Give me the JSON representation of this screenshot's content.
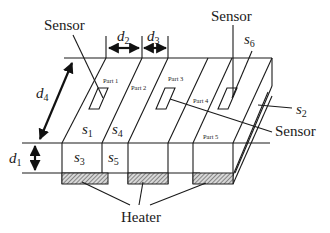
{
  "diagram": {
    "type": "3d-schematic",
    "labels": {
      "sensor_top_left": "Sensor",
      "sensor_top_right": "Sensor",
      "sensor_right": "Sensor",
      "heater": "Heater"
    },
    "dimensions": {
      "d1": {
        "var": "d",
        "sub": "1"
      },
      "d2": {
        "var": "d",
        "sub": "2"
      },
      "d3": {
        "var": "d",
        "sub": "3"
      },
      "d4": {
        "var": "d",
        "sub": "4"
      }
    },
    "surfaces": {
      "s1": {
        "var": "s",
        "sub": "1"
      },
      "s2": {
        "var": "s",
        "sub": "2"
      },
      "s3": {
        "var": "s",
        "sub": "3"
      },
      "s4": {
        "var": "s",
        "sub": "4"
      },
      "s5": {
        "var": "s",
        "sub": "5"
      },
      "s6": {
        "var": "s",
        "sub": "6"
      }
    },
    "parts": [
      "Part 1",
      "Part 2",
      "Part 3",
      "Part 4",
      "Part 5"
    ],
    "colors": {
      "line": "#1a1a1a",
      "background": "#ffffff",
      "heater_fill": "#bfbfbf"
    }
  }
}
